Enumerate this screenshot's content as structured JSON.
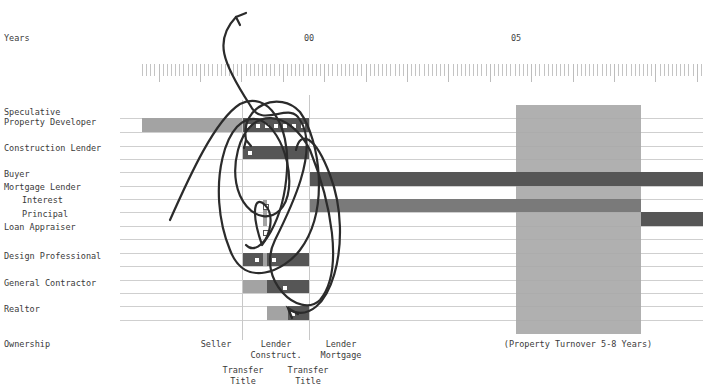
{
  "axis": {
    "label": "Years",
    "year_labels": [
      {
        "text": "00",
        "x": 309
      },
      {
        "text": "05",
        "x": 516
      }
    ],
    "ruler_start_x": 142,
    "px_per_year": 41.4,
    "minor_ticks_per_year": 10
  },
  "rows": [
    {
      "label": "Speculative",
      "y": 112
    },
    {
      "label": "Property Developer",
      "y": 122
    },
    {
      "label": "Construction Lender",
      "y": 148
    },
    {
      "label": "Buyer",
      "y": 174
    },
    {
      "label": "Mortgage Lender",
      "y": 187
    },
    {
      "label": "Interest",
      "y": 200,
      "indent": true
    },
    {
      "label": "Principal",
      "y": 214,
      "indent": true
    },
    {
      "label": "Loan Appraiser",
      "y": 227
    },
    {
      "label": "Design Professional",
      "y": 256
    },
    {
      "label": "General Contractor",
      "y": 283
    },
    {
      "label": "Realtor",
      "y": 309
    },
    {
      "label": "Ownership",
      "y": 344
    }
  ],
  "colors": {
    "light": "#a3a3a3",
    "medium": "#7a7a7a",
    "dark": "#565656",
    "turnover_block": "#a9a9a9",
    "scribble": "#2b2b2b"
  },
  "chart_data": {
    "type": "gantt",
    "title": "",
    "xlabel": "Years",
    "x_ticks": [
      "00",
      "05"
    ],
    "series": [
      {
        "name": "Speculative Property Developer",
        "segments": [
          {
            "start": -4.0,
            "end": -1.6,
            "shade": "light"
          },
          {
            "start": -1.6,
            "end": 0,
            "shade": "dark"
          }
        ]
      },
      {
        "name": "Construction Lender",
        "segments": [
          {
            "start": -1.6,
            "end": 0,
            "shade": "dark"
          }
        ]
      },
      {
        "name": "Buyer",
        "segments": [
          {
            "start": 0,
            "end": 9.5,
            "shade": "dark"
          }
        ]
      },
      {
        "name": "Mortgage Lender - Interest",
        "segments": [
          {
            "start": 0,
            "end": 8,
            "shade": "medium"
          }
        ]
      },
      {
        "name": "Mortgage Lender - Principal",
        "segments": [
          {
            "start": 8,
            "end": 9.5,
            "shade": "dark"
          }
        ]
      },
      {
        "name": "Loan Appraiser",
        "segments": [
          {
            "start": -1.1,
            "end": -1.0,
            "shade": "light"
          }
        ]
      },
      {
        "name": "Design Professional",
        "segments": [
          {
            "start": -1.6,
            "end": -1.1,
            "shade": "dark"
          },
          {
            "start": -1.1,
            "end": -1.0,
            "shade": "light"
          },
          {
            "start": -1.0,
            "end": 0,
            "shade": "dark"
          }
        ]
      },
      {
        "name": "General Contractor",
        "segments": [
          {
            "start": -1.6,
            "end": -1.0,
            "shade": "light"
          },
          {
            "start": -1.0,
            "end": 0,
            "shade": "dark"
          }
        ]
      },
      {
        "name": "Realtor",
        "segments": [
          {
            "start": -1.0,
            "end": -0.5,
            "shade": "light"
          },
          {
            "start": -0.5,
            "end": 0,
            "shade": "dark"
          }
        ]
      }
    ],
    "annotations": [
      {
        "text": "(Property Turnover 5-8 Years)",
        "start": 5,
        "end": 8
      }
    ]
  },
  "bars": [
    {
      "x": 142,
      "y": 118,
      "w": 100,
      "h": 14,
      "shade": "light"
    },
    {
      "x": 242,
      "y": 118,
      "w": 67,
      "h": 14,
      "shade": "dark"
    },
    {
      "x": 242,
      "y": 146,
      "w": 67,
      "h": 13,
      "shade": "dark"
    },
    {
      "x": 309,
      "y": 172,
      "w": 394,
      "h": 14,
      "shade": "dark"
    },
    {
      "x": 309,
      "y": 199,
      "w": 332,
      "h": 13,
      "shade": "medium"
    },
    {
      "x": 641,
      "y": 212,
      "w": 62,
      "h": 14,
      "shade": "dark"
    },
    {
      "x": 263,
      "y": 200,
      "w": 4,
      "h": 26,
      "shade": "light"
    },
    {
      "x": 242,
      "y": 253,
      "w": 21,
      "h": 13,
      "shade": "dark"
    },
    {
      "x": 263,
      "y": 253,
      "w": 4,
      "h": 13,
      "shade": "light"
    },
    {
      "x": 267,
      "y": 253,
      "w": 42,
      "h": 13,
      "shade": "dark"
    },
    {
      "x": 242,
      "y": 280,
      "w": 25,
      "h": 13,
      "shade": "light"
    },
    {
      "x": 267,
      "y": 280,
      "w": 42,
      "h": 13,
      "shade": "dark"
    },
    {
      "x": 267,
      "y": 306,
      "w": 21,
      "h": 14,
      "shade": "light"
    },
    {
      "x": 288,
      "y": 306,
      "w": 21,
      "h": 14,
      "shade": "dark"
    }
  ],
  "dots": [
    {
      "x": 248,
      "y": 125
    },
    {
      "x": 257,
      "y": 125
    },
    {
      "x": 266,
      "y": 125
    },
    {
      "x": 275,
      "y": 125
    },
    {
      "x": 284,
      "y": 125
    },
    {
      "x": 293,
      "y": 125
    },
    {
      "x": 302,
      "y": 125
    },
    {
      "x": 249,
      "y": 152
    },
    {
      "x": 265,
      "y": 206
    },
    {
      "x": 265,
      "y": 232
    },
    {
      "x": 256,
      "y": 259
    },
    {
      "x": 273,
      "y": 259
    },
    {
      "x": 284,
      "y": 287
    },
    {
      "x": 292,
      "y": 313
    }
  ],
  "turnover_block": {
    "x": 516,
    "y": 105,
    "w": 125,
    "h": 229
  },
  "ownership": {
    "labels": [
      {
        "text": "Seller",
        "x": 216,
        "y": 344
      },
      {
        "text": "Lender\nConstruct.",
        "x": 276,
        "y": 344
      },
      {
        "text": "Lender\nMortgage",
        "x": 341,
        "y": 344
      },
      {
        "text": "(Property Turnover 5-8 Years)",
        "x": 578,
        "y": 344
      },
      {
        "text": "Transfer\nTitle",
        "x": 243,
        "y": 370
      },
      {
        "text": "Transfer\nTitle",
        "x": 308,
        "y": 370
      }
    ]
  },
  "hlines_y": [
    118,
    132,
    146,
    159,
    172,
    186,
    199,
    212,
    226,
    239,
    253,
    266,
    280,
    293,
    306,
    320
  ],
  "vlines": [
    {
      "x": 242,
      "y1": 100,
      "y2": 340
    },
    {
      "x": 309,
      "y1": 95,
      "y2": 340
    }
  ]
}
